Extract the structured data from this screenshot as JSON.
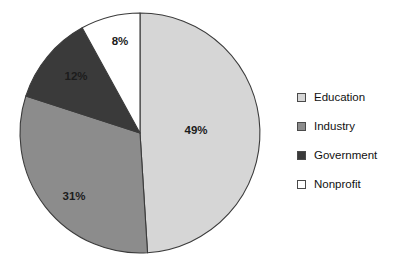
{
  "chart_data": {
    "type": "pie",
    "title": "",
    "subtitle": "",
    "xlabel": "",
    "ylabel": "",
    "grid": false,
    "legend_position": "right",
    "start_angle_deg": 0,
    "direction": "clockwise",
    "categories": [
      "Education",
      "Industry",
      "Government",
      "Nonprofit"
    ],
    "values": [
      49,
      31,
      12,
      8
    ],
    "value_unit": "%",
    "data_labels": [
      "49%",
      "31%",
      "12%",
      "8%"
    ],
    "slice_colors": [
      "#d6d6d6",
      "#8c8c8c",
      "#3a3a3a",
      "#ffffff"
    ],
    "slice_edge_color": "#3b3b3b",
    "slices": [
      {
        "label": "Education",
        "value": 49,
        "data_label": "49%",
        "color": "#d6d6d6",
        "label_x": 196,
        "label_y": 131
      },
      {
        "label": "Industry",
        "value": 31,
        "data_label": "31%",
        "color": "#8c8c8c",
        "label_x": 74,
        "label_y": 197
      },
      {
        "label": "Government",
        "value": 12,
        "data_label": "12%",
        "color": "#3a3a3a",
        "label_x": 76,
        "label_y": 77
      },
      {
        "label": "Nonprofit",
        "value": 8,
        "data_label": "8%",
        "color": "#ffffff",
        "label_x": 120,
        "label_y": 42
      }
    ],
    "geometry": {
      "center_x": 140,
      "center_y": 133,
      "radius": 120
    }
  },
  "legend": {
    "items": [
      {
        "label": "Education",
        "color": "#d6d6d6"
      },
      {
        "label": "Industry",
        "color": "#8c8c8c"
      },
      {
        "label": "Government",
        "color": "#3a3a3a"
      },
      {
        "label": "Nonprofit",
        "color": "#ffffff"
      }
    ]
  },
  "background_color": "#ffffff"
}
